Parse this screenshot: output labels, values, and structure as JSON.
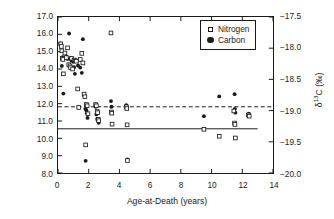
{
  "figure": {
    "background": "#ffffff",
    "ink": "#1a1a1a"
  },
  "axes": {
    "x": {
      "label": "Age-at-Death (years)",
      "ticks": [
        0,
        2,
        4,
        6,
        8,
        10,
        12,
        14
      ],
      "tick_labels": [
        "0",
        "2",
        "4",
        "6",
        "8",
        "10",
        "12",
        "14"
      ],
      "lim": [
        0,
        14
      ]
    },
    "y_left": {
      "label_html": "δ<sup>15</sup>N (‰)",
      "label_text": "δ15N (‰)",
      "ticks": [
        8.0,
        9.0,
        10.0,
        11.0,
        12.0,
        13.0,
        14.0,
        15.0,
        16.0,
        17.0
      ],
      "tick_labels": [
        "8.0",
        "9.0",
        "10.0",
        "11.0",
        "12.0",
        "13.0",
        "14.0",
        "15.0",
        "16.0",
        "17.0"
      ],
      "lim": [
        8.0,
        17.0
      ]
    },
    "y_right": {
      "label_html": "δ<sup>13</sup>C (‰)",
      "label_text": "δ13C (‰)",
      "ticks": [
        -20.0,
        -19.5,
        -19.0,
        -18.5,
        -18.0,
        -17.5
      ],
      "tick_labels": [
        "−20.0",
        "−19.5",
        "−19.0",
        "−18.5",
        "−18.0",
        "−17.5"
      ],
      "lim": [
        -20.0,
        -17.5
      ]
    }
  },
  "legend": {
    "position": "top-right",
    "entries": [
      {
        "marker": "open-square",
        "label": "Nitrogen"
      },
      {
        "marker": "filled-circle",
        "label": "Carbon"
      }
    ]
  },
  "chart_data": {
    "type": "scatter",
    "title": "",
    "xlabel": "Age-at-Death (years)",
    "ylabel": "δ15N (‰)",
    "ylabel_secondary": "δ13C (‰)",
    "xlim": [
      0,
      14
    ],
    "ylim": [
      8.0,
      17.0
    ],
    "ylim_secondary": [
      -20.0,
      -17.5
    ],
    "grid": false,
    "legend_position": "top-right",
    "series": [
      {
        "name": "Nitrogen",
        "marker": "open-square",
        "axis": "left",
        "unit": "‰",
        "points": [
          [
            0.18,
            15.45
          ],
          [
            0.22,
            15.3
          ],
          [
            0.25,
            15.05
          ],
          [
            0.28,
            14.62
          ],
          [
            0.32,
            14.55
          ],
          [
            0.35,
            13.72
          ],
          [
            0.45,
            14.92
          ],
          [
            0.55,
            14.66
          ],
          [
            0.62,
            15.22
          ],
          [
            0.7,
            14.25
          ],
          [
            0.78,
            14.18
          ],
          [
            0.82,
            14.08
          ],
          [
            0.88,
            14.62
          ],
          [
            0.95,
            14.0
          ],
          [
            1.05,
            14.52
          ],
          [
            1.12,
            14.48
          ],
          [
            1.2,
            14.45
          ],
          [
            1.28,
            12.85
          ],
          [
            1.35,
            11.78
          ],
          [
            1.45,
            14.55
          ],
          [
            1.55,
            14.9
          ],
          [
            1.62,
            14.35
          ],
          [
            1.7,
            12.55
          ],
          [
            1.75,
            12.4
          ],
          [
            1.8,
            9.62
          ],
          [
            1.85,
            11.95
          ],
          [
            1.9,
            11.88
          ],
          [
            1.95,
            11.42
          ],
          [
            2.45,
            11.95
          ],
          [
            2.5,
            11.88
          ],
          [
            2.55,
            11.55
          ],
          [
            2.58,
            11.48
          ],
          [
            2.62,
            11.1
          ],
          [
            2.65,
            11.02
          ],
          [
            3.45,
            16.08
          ],
          [
            3.48,
            11.52
          ],
          [
            3.5,
            11.45
          ],
          [
            3.52,
            10.82
          ],
          [
            4.45,
            11.82
          ],
          [
            4.48,
            11.72
          ],
          [
            4.5,
            10.78
          ],
          [
            4.52,
            8.72
          ],
          [
            9.5,
            10.52
          ],
          [
            10.5,
            10.12
          ],
          [
            11.45,
            11.58
          ],
          [
            11.5,
            10.88
          ],
          [
            11.52,
            10.8
          ],
          [
            11.55,
            10.02
          ],
          [
            12.4,
            11.35
          ],
          [
            12.45,
            11.28
          ]
        ]
      },
      {
        "name": "Carbon",
        "marker": "filled-circle",
        "axis": "right",
        "unit": "‰",
        "points_left_scale": [
          [
            0.15,
            15.48
          ],
          [
            0.2,
            15.42
          ],
          [
            0.25,
            14.18
          ],
          [
            0.3,
            14.68
          ],
          [
            0.35,
            12.58
          ],
          [
            0.55,
            14.72
          ],
          [
            0.62,
            14.58
          ],
          [
            0.72,
            16.05
          ],
          [
            0.8,
            14.62
          ],
          [
            0.85,
            14.55
          ],
          [
            0.88,
            14.48
          ],
          [
            0.95,
            14.52
          ],
          [
            1.0,
            14.42
          ],
          [
            1.05,
            14.1
          ],
          [
            1.1,
            13.72
          ],
          [
            1.25,
            14.48
          ],
          [
            1.3,
            14.2
          ],
          [
            1.35,
            11.8
          ],
          [
            1.45,
            14.08
          ],
          [
            1.55,
            13.78
          ],
          [
            1.62,
            15.72
          ],
          [
            1.7,
            12.48
          ],
          [
            1.78,
            11.7
          ],
          [
            1.8,
            8.7
          ],
          [
            1.85,
            11.62
          ],
          [
            1.88,
            11.45
          ],
          [
            1.92,
            11.18
          ],
          [
            2.45,
            11.82
          ],
          [
            2.5,
            11.38
          ],
          [
            2.55,
            11.12
          ],
          [
            2.6,
            11.05
          ],
          [
            2.65,
            10.9
          ],
          [
            3.45,
            12.15
          ],
          [
            3.48,
            11.82
          ],
          [
            3.5,
            11.48
          ],
          [
            4.45,
            11.92
          ],
          [
            4.48,
            11.8
          ],
          [
            4.52,
            8.78
          ],
          [
            9.5,
            11.28
          ],
          [
            10.5,
            12.42
          ],
          [
            11.5,
            12.55
          ],
          [
            11.52,
            11.7
          ],
          [
            11.55,
            11.48
          ],
          [
            12.42,
            11.42
          ]
        ]
      }
    ],
    "reference_lines": [
      {
        "name": "nitrogen-mean-dashed",
        "style": "dashed",
        "y_left": 11.82,
        "x_from": 0,
        "x_to": 14
      },
      {
        "name": "carbon-mean-solid",
        "style": "solid",
        "y_left": 10.55,
        "x_from": 0,
        "x_to": 13.0
      }
    ]
  }
}
